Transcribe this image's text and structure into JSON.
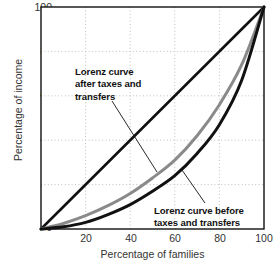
{
  "chart_data": {
    "type": "line",
    "title": "",
    "xlabel": "Percentage of families",
    "ylabel": "Percentage of income",
    "xlim": [
      0,
      100
    ],
    "ylim": [
      0,
      100
    ],
    "xticks": [
      0,
      20,
      40,
      60,
      80,
      100
    ],
    "yticks": [
      0,
      20,
      40,
      60,
      80,
      100
    ],
    "xtick_labels": [
      "",
      "20",
      "40",
      "60",
      "80",
      "100"
    ],
    "ytick_labels": [
      "0",
      "20",
      "40",
      "60",
      "80",
      "100"
    ],
    "grid": true,
    "legend": "none",
    "series": [
      {
        "name": "Line of perfect equality",
        "color": "#111111",
        "width": 2.6,
        "x": [
          0,
          100
        ],
        "values": [
          0,
          100
        ]
      },
      {
        "name": "Lorenz curve after taxes and transfers",
        "color": "#8a8a8a",
        "width": 3.0,
        "x": [
          0,
          10,
          20,
          30,
          40,
          50,
          60,
          70,
          80,
          90,
          100
        ],
        "values": [
          0,
          2.5,
          6,
          10.5,
          16,
          23,
          31,
          42,
          56,
          74,
          100
        ]
      },
      {
        "name": "Lorenz curve before taxes and transfers",
        "color": "#111111",
        "width": 3.0,
        "x": [
          0,
          10,
          20,
          30,
          40,
          50,
          60,
          70,
          80,
          90,
          100
        ],
        "values": [
          0,
          1,
          3,
          6.5,
          11,
          17,
          24,
          34,
          47,
          67,
          100
        ]
      }
    ],
    "annotations": [
      {
        "id": "after",
        "lines": [
          "Lorenz curve",
          "after taxes and",
          "transfers"
        ],
        "text": "Lorenz curve after taxes and transfers",
        "points_to": [
          52,
          28
        ]
      },
      {
        "id": "before",
        "lines": [
          "Lorenz curve before",
          "taxes and transfers"
        ],
        "text": "Lorenz curve before taxes and transfers",
        "points_to": [
          63,
          27
        ]
      }
    ],
    "colors": {
      "after_taxes": "#8a8a8a",
      "before_taxes": "#111111",
      "equality_line": "#111111",
      "grid": "#b9b9b9",
      "axis": "#111111",
      "background": "#ffffff"
    }
  },
  "axes": {
    "x_title": "Percentage of families",
    "y_title": "Percentage of income",
    "x_ticks": [
      "20",
      "40",
      "60",
      "80",
      "100"
    ],
    "y_ticks": [
      "100",
      "80",
      "60",
      "40",
      "20",
      "0"
    ]
  },
  "annotations": {
    "after": {
      "line1": "Lorenz curve",
      "line2": "after taxes and",
      "line3": "transfers"
    },
    "before": {
      "line1": "Lorenz curve before",
      "line2": "taxes and transfers"
    }
  }
}
